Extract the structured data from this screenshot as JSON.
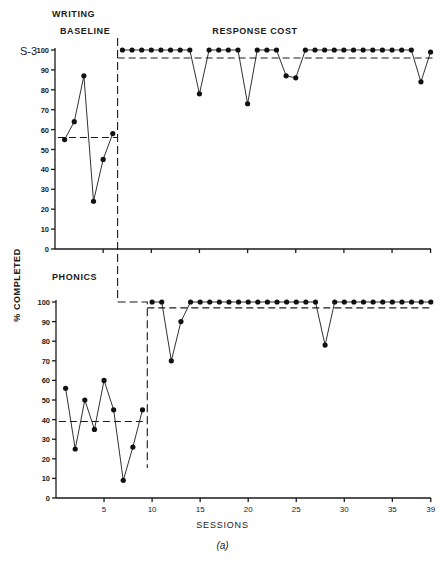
{
  "figure": {
    "subject_label": "S-3",
    "y_axis_label": "% COMPLETED",
    "x_axis_label": "SESSIONS",
    "caption": "(a)"
  },
  "chart_data": [
    {
      "type": "line",
      "title": "WRITING",
      "phases": [
        {
          "label": "BASELINE",
          "sessions": [
            1,
            2,
            3,
            4,
            5,
            6
          ],
          "values": [
            55,
            64,
            87,
            24,
            45,
            58
          ],
          "mean": 56
        },
        {
          "label": "RESPONSE COST",
          "sessions": [
            7,
            8,
            9,
            10,
            11,
            12,
            13,
            14,
            15,
            16,
            17,
            18,
            19,
            20,
            21,
            22,
            23,
            24,
            25,
            26,
            27,
            28,
            29,
            30,
            31,
            32,
            33,
            34,
            35,
            36,
            37,
            38,
            39
          ],
          "values": [
            100,
            100,
            100,
            100,
            100,
            100,
            100,
            100,
            78,
            100,
            100,
            100,
            100,
            73,
            100,
            100,
            100,
            87,
            86,
            100,
            100,
            100,
            100,
            100,
            100,
            100,
            100,
            100,
            100,
            100,
            100,
            84,
            99
          ],
          "mean": 96
        }
      ],
      "phase_change_after_session": 6.5,
      "xlabel": "",
      "ylabel": "% COMPLETED",
      "yticks": [
        0,
        10,
        20,
        30,
        40,
        50,
        60,
        70,
        80,
        90,
        100
      ],
      "xticks": [
        5,
        10,
        15,
        20,
        25,
        30,
        35,
        39
      ],
      "ylim": [
        0,
        100
      ],
      "xlim": [
        0,
        39
      ],
      "grid": false
    },
    {
      "type": "line",
      "title": "PHONICS",
      "phases": [
        {
          "label": "BASELINE",
          "sessions": [
            1,
            2,
            3,
            4,
            5,
            6,
            7,
            8,
            9
          ],
          "values": [
            56,
            25,
            50,
            35,
            60,
            45,
            9,
            26,
            45
          ],
          "mean": 39
        },
        {
          "label": "RESPONSE COST",
          "sessions": [
            10,
            11,
            12,
            13,
            14,
            15,
            16,
            17,
            18,
            19,
            20,
            21,
            22,
            23,
            24,
            25,
            26,
            27,
            28,
            29,
            30,
            31,
            32,
            33,
            34,
            35,
            36,
            37,
            38,
            39
          ],
          "values": [
            100,
            100,
            70,
            90,
            100,
            100,
            100,
            100,
            100,
            100,
            100,
            100,
            100,
            100,
            100,
            100,
            100,
            100,
            78,
            100,
            100,
            100,
            100,
            100,
            100,
            100,
            100,
            100,
            100,
            100
          ],
          "mean": 97
        }
      ],
      "phase_change_after_session": 9.5,
      "xlabel": "SESSIONS",
      "ylabel": "% COMPLETED",
      "yticks": [
        0,
        10,
        20,
        30,
        40,
        50,
        60,
        70,
        80,
        90,
        100
      ],
      "xticks": [
        5,
        10,
        15,
        20,
        25,
        30,
        35,
        39
      ],
      "xtick_labels": [
        "5",
        "10",
        "15",
        "20",
        "25",
        "30",
        "35",
        "39"
      ],
      "ylim": [
        0,
        100
      ],
      "xlim": [
        0,
        39
      ],
      "grid": false
    }
  ],
  "layout": {
    "panels": [
      {
        "x0": 55,
        "y0": 249,
        "y100": 50,
        "px_per_session": 9.63,
        "title_x": 52,
        "title_y": 17,
        "phase_label_y": 34
      },
      {
        "x0": 56,
        "y0": 498,
        "y100": 302,
        "px_per_session": 9.61,
        "title_x": 52,
        "title_y": 280,
        "phase_label_y": 0
      }
    ]
  }
}
